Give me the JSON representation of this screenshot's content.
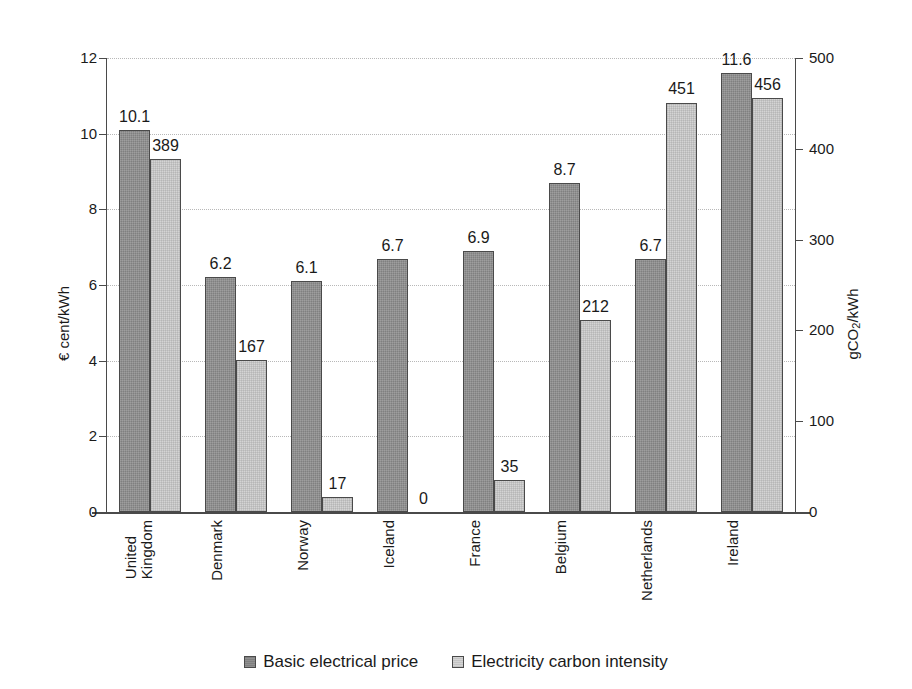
{
  "chart_data": {
    "type": "bar",
    "title": "",
    "xlabel": "",
    "categories": [
      "United Kingdom",
      "Denmark",
      "Norway",
      "Iceland",
      "France",
      "Belgium",
      "Netherlands",
      "Ireland"
    ],
    "category_lines": [
      [
        "United",
        "Kingdom"
      ],
      [
        "Denmark"
      ],
      [
        "Norway"
      ],
      [
        "Iceland"
      ],
      [
        "France"
      ],
      [
        "Belgium"
      ],
      [
        "Netherlands"
      ],
      [
        "Ireland"
      ]
    ],
    "series": [
      {
        "name": "Basic electrical price",
        "axis": "left",
        "color": "#808080",
        "values": [
          10.1,
          6.2,
          6.1,
          6.7,
          6.9,
          8.7,
          6.7,
          11.6
        ],
        "labels": [
          "10.1",
          "6.2",
          "6.1",
          "6.7",
          "6.9",
          "8.7",
          "6.7",
          "11.6"
        ]
      },
      {
        "name": "Electricity carbon intensity",
        "axis": "right",
        "color": "#d4d4d4",
        "values": [
          389,
          167,
          17,
          0,
          35,
          212,
          451,
          456
        ],
        "labels": [
          "389",
          "167",
          "17",
          "0",
          "35",
          "212",
          "451",
          "456"
        ]
      }
    ],
    "left_axis": {
      "label": "€ cent/kWh",
      "label_plain": "€ cent/kWh",
      "ticks": [
        "0",
        "2",
        "4",
        "6",
        "8",
        "10",
        "12"
      ],
      "min": 0,
      "max": 12,
      "step": 2
    },
    "right_axis": {
      "label": "gCO2/kWh",
      "label_prefix": "gCO",
      "label_sub": "2",
      "label_suffix": "/kWh",
      "ticks": [
        "0",
        "100",
        "200",
        "300",
        "400",
        "500"
      ],
      "min": 0,
      "max": 500,
      "step": 100
    },
    "grid": true,
    "legend_position": "bottom"
  },
  "legend": {
    "items": [
      {
        "label": "Basic electrical price",
        "swatch": "dark"
      },
      {
        "label": "Electricity carbon intensity",
        "swatch": "light"
      }
    ]
  }
}
